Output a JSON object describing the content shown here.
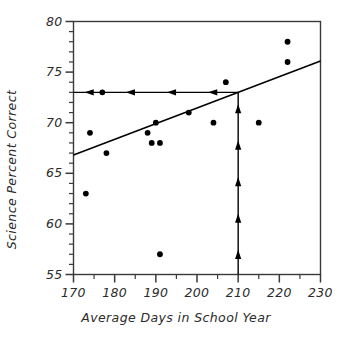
{
  "chart_data": {
    "type": "scatter",
    "title": "",
    "subtitle": "",
    "xlabel": "Average Days in School Year",
    "ylabel": "Science Percent Correct",
    "xlim": [
      170,
      230
    ],
    "ylim": [
      55,
      80
    ],
    "xticks": [
      170,
      180,
      190,
      200,
      210,
      220,
      230
    ],
    "xtick_labels": [
      "170",
      "180",
      "190",
      "200",
      "210",
      "220",
      "230"
    ],
    "yticks": [
      55,
      60,
      65,
      70,
      75,
      80
    ],
    "ytick_labels": [
      "55",
      "60",
      "65",
      "70",
      "75",
      "80"
    ],
    "x_minor_tick_step": 5,
    "y_minor_tick_step": 1,
    "grid": false,
    "legend": null,
    "point_color": "#000000",
    "line_color": "#000000",
    "axis_color": "#3a3a3a",
    "points": [
      {
        "x": 173,
        "y": 63
      },
      {
        "x": 174,
        "y": 69
      },
      {
        "x": 177,
        "y": 73
      },
      {
        "x": 178,
        "y": 67
      },
      {
        "x": 188,
        "y": 69
      },
      {
        "x": 189,
        "y": 68
      },
      {
        "x": 190,
        "y": 70
      },
      {
        "x": 191,
        "y": 68
      },
      {
        "x": 191,
        "y": 57
      },
      {
        "x": 198,
        "y": 71
      },
      {
        "x": 204,
        "y": 70
      },
      {
        "x": 207,
        "y": 74
      },
      {
        "x": 215,
        "y": 70
      },
      {
        "x": 222,
        "y": 76
      },
      {
        "x": 222,
        "y": 78
      }
    ],
    "trend_line": {
      "name": "regression-line",
      "x_start": 170,
      "y_start": 66.8,
      "x_end": 230,
      "y_end": 76.1
    },
    "annotations": [
      {
        "name": "horizontal-reference-line",
        "orientation": "horizontal",
        "y": 73,
        "x_from": 210,
        "x_to": 170,
        "arrow_direction": "left",
        "arrow_count": 4
      },
      {
        "name": "vertical-reference-line",
        "orientation": "vertical",
        "x": 210,
        "y_from": 55,
        "y_to": 73,
        "arrow_direction": "up",
        "arrow_count": 5
      }
    ]
  }
}
